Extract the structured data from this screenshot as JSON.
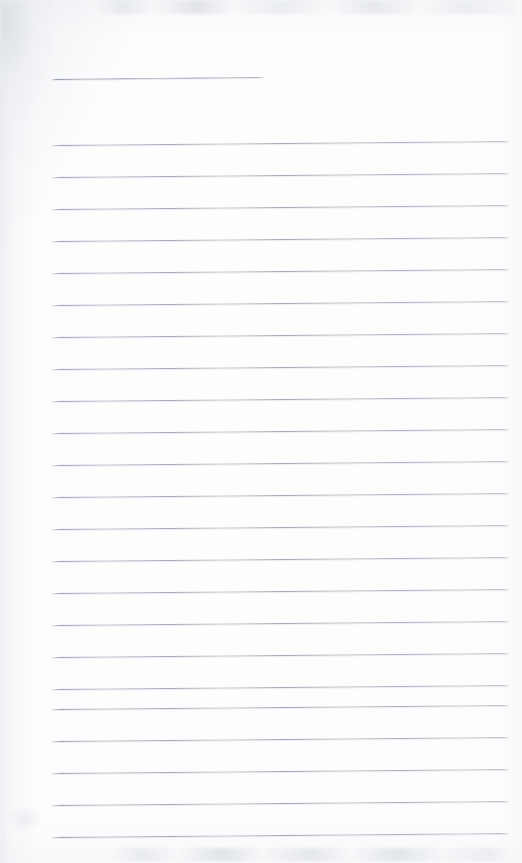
{
  "page": {
    "kind": "scanned-blank-lined-page",
    "width": 522,
    "height": 863,
    "background_color": "#fdfdfe",
    "visible_text": "",
    "handwriting": "",
    "printed_text": "",
    "note": "Blank ruled notebook page; no text, labels or numbers are rendered in the pixels."
  },
  "rules": {
    "line_color": "#939cb0",
    "line_thickness_px": 1,
    "left_margin_px": 52,
    "right_edge_px": 508,
    "spacing_px": 32,
    "title_rule": {
      "x_start": 52,
      "x_end": 265,
      "y": 79,
      "slant_px": -2
    },
    "body_lines": [
      {
        "y": 145,
        "x_start": 52,
        "x_end": 509,
        "slant_px": -4
      },
      {
        "y": 177,
        "x_start": 52,
        "x_end": 509,
        "slant_px": -4
      },
      {
        "y": 209,
        "x_start": 52,
        "x_end": 509,
        "slant_px": -4
      },
      {
        "y": 241,
        "x_start": 52,
        "x_end": 509,
        "slant_px": -4
      },
      {
        "y": 273,
        "x_start": 52,
        "x_end": 509,
        "slant_px": -4
      },
      {
        "y": 305,
        "x_start": 52,
        "x_end": 509,
        "slant_px": -4
      },
      {
        "y": 337,
        "x_start": 52,
        "x_end": 509,
        "slant_px": -4
      },
      {
        "y": 369,
        "x_start": 52,
        "x_end": 509,
        "slant_px": -4
      },
      {
        "y": 401,
        "x_start": 52,
        "x_end": 509,
        "slant_px": -4
      },
      {
        "y": 433,
        "x_start": 52,
        "x_end": 509,
        "slant_px": -4
      },
      {
        "y": 465,
        "x_start": 52,
        "x_end": 509,
        "slant_px": -4
      },
      {
        "y": 497,
        "x_start": 52,
        "x_end": 509,
        "slant_px": -4
      },
      {
        "y": 529,
        "x_start": 52,
        "x_end": 509,
        "slant_px": -4
      },
      {
        "y": 561,
        "x_start": 52,
        "x_end": 509,
        "slant_px": -4
      },
      {
        "y": 593,
        "x_start": 52,
        "x_end": 509,
        "slant_px": -4
      },
      {
        "y": 625,
        "x_start": 52,
        "x_end": 509,
        "slant_px": -4
      },
      {
        "y": 657,
        "x_start": 52,
        "x_end": 509,
        "slant_px": -4
      },
      {
        "y": 689,
        "x_start": 52,
        "x_end": 509,
        "slant_px": -4
      },
      {
        "y": 709,
        "x_start": 52,
        "x_end": 509,
        "slant_px": -4
      },
      {
        "y": 741,
        "x_start": 52,
        "x_end": 509,
        "slant_px": -4
      },
      {
        "y": 773,
        "x_start": 52,
        "x_end": 509,
        "slant_px": -4
      },
      {
        "y": 805,
        "x_start": 52,
        "x_end": 509,
        "slant_px": -4
      },
      {
        "y": 837,
        "x_start": 52,
        "x_end": 509,
        "slant_px": -4
      }
    ]
  },
  "scan_artifacts": [
    {
      "name": "top-edge-smudge-band",
      "x": 96,
      "y": 0,
      "width": 420,
      "height": 14
    },
    {
      "name": "bottom-edge-smudge-band",
      "x": 110,
      "y": 848,
      "width": 400,
      "height": 13
    },
    {
      "name": "upper-left-corner-shadow",
      "x": 0,
      "y": 0,
      "width": 52,
      "height": 120
    },
    {
      "name": "left-edge-shadow-band",
      "x": 0,
      "y": 0,
      "width": 16,
      "height": 863
    },
    {
      "name": "lower-left-speck",
      "x": 8,
      "y": 806,
      "width": 34,
      "height": 26
    }
  ]
}
